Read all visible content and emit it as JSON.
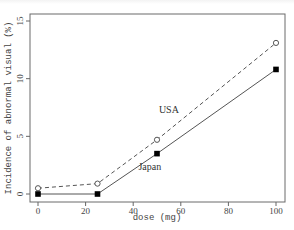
{
  "chart_data": {
    "type": "line",
    "title": "",
    "xlabel": "dose (mg)",
    "ylabel": "Incidence of abnormal visual (%)",
    "xlim": [
      0,
      100
    ],
    "ylim": [
      0,
      15
    ],
    "xticks": [
      0,
      20,
      40,
      60,
      80,
      100
    ],
    "yticks": [
      0,
      5,
      10,
      15
    ],
    "grid": false,
    "legend": "inline labels",
    "x": [
      0,
      25,
      50,
      100
    ],
    "series": [
      {
        "name": "USA",
        "style": "dashed",
        "marker": "open-circle",
        "values": [
          0.5,
          0.9,
          4.7,
          13.1
        ]
      },
      {
        "name": "Japan",
        "style": "solid",
        "marker": "filled-square",
        "values": [
          0.0,
          0.0,
          3.5,
          10.8
        ]
      }
    ],
    "annotations": [
      {
        "text": "USA",
        "x": 55,
        "y": 7
      },
      {
        "text": "Japan",
        "x": 47,
        "y": 2.1
      }
    ]
  },
  "colors": {
    "line": "#555555",
    "frame": "#666666",
    "marker_fill": "#000000"
  }
}
